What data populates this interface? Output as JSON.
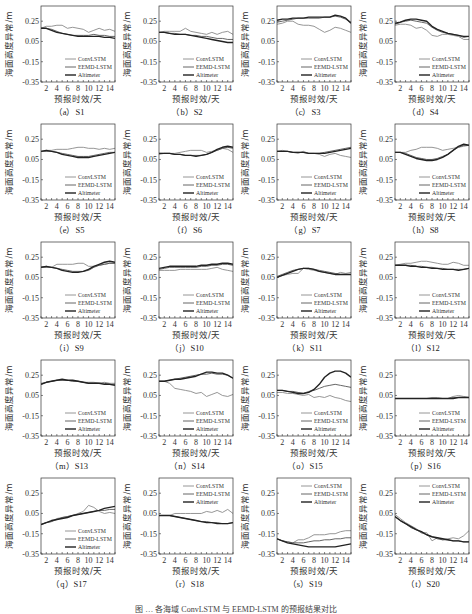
{
  "figure": {
    "caption_partial": "图 … 各海域 ConvLSTM 与 EEMD-LSTM 的预报结果对比"
  },
  "chart_data": {
    "type": "line",
    "shared": {
      "ylabel": "海面高度异常/m",
      "xlabel": "预报时效/天",
      "yticks": [
        0.25,
        0.05,
        -0.15,
        -0.35
      ],
      "ytick_labels": [
        "0.25",
        "0.05",
        "-0.15",
        "-0.35"
      ],
      "xticks": [
        2,
        4,
        6,
        8,
        10,
        12,
        14
      ],
      "ylim": [
        -0.35,
        0.4
      ],
      "xlim": [
        1,
        15
      ],
      "legend": [
        "ConvLSTM",
        "EEMD-LSTM",
        "Altimeter"
      ],
      "series_colors": {
        "ConvLSTM": "#8a8a8a",
        "EEMD-LSTM": "#555555",
        "Altimeter": "#222222"
      },
      "x": [
        1,
        2,
        3,
        4,
        5,
        6,
        7,
        8,
        9,
        10,
        11,
        12,
        13,
        14,
        15
      ]
    },
    "panels": [
      {
        "label": "（a）S1",
        "legend_pos": "bottom",
        "ConvLSTM": [
          0.18,
          0.2,
          0.2,
          0.21,
          0.21,
          0.18,
          0.19,
          0.18,
          0.17,
          0.14,
          0.16,
          0.18,
          0.16,
          0.17,
          0.15
        ],
        "EEMD-LSTM": [
          0.18,
          0.18,
          0.17,
          0.15,
          0.13,
          0.12,
          0.11,
          0.11,
          0.11,
          0.11,
          0.12,
          0.11,
          0.11,
          0.1,
          0.1
        ],
        "Altimeter": [
          0.18,
          0.18,
          0.16,
          0.14,
          0.13,
          0.12,
          0.11,
          0.1,
          0.1,
          0.1,
          0.1,
          0.1,
          0.09,
          0.09,
          0.08
        ]
      },
      {
        "label": "（b）S2",
        "legend_pos": "bottom",
        "ConvLSTM": [
          0.14,
          0.15,
          0.15,
          0.15,
          0.15,
          0.18,
          0.15,
          0.14,
          0.13,
          0.12,
          0.14,
          0.12,
          0.14,
          0.15,
          0.12
        ],
        "EEMD-LSTM": [
          0.14,
          0.14,
          0.13,
          0.13,
          0.12,
          0.12,
          0.11,
          0.11,
          0.1,
          0.1,
          0.09,
          0.08,
          0.08,
          0.07,
          0.07
        ],
        "Altimeter": [
          0.14,
          0.14,
          0.13,
          0.12,
          0.12,
          0.12,
          0.11,
          0.1,
          0.09,
          0.08,
          0.07,
          0.06,
          0.05,
          0.04,
          0.04
        ]
      },
      {
        "label": "（c）S3",
        "legend_pos": "bottom",
        "ConvLSTM": [
          0.22,
          0.23,
          0.25,
          0.25,
          0.22,
          0.21,
          0.21,
          0.2,
          0.17,
          0.14,
          0.16,
          0.19,
          0.18,
          0.16,
          0.14
        ],
        "EEMD-LSTM": [
          0.24,
          0.25,
          0.26,
          0.27,
          0.28,
          0.28,
          0.28,
          0.28,
          0.28,
          0.29,
          0.29,
          0.3,
          0.29,
          0.27,
          0.24
        ],
        "Altimeter": [
          0.26,
          0.27,
          0.27,
          0.28,
          0.28,
          0.28,
          0.29,
          0.29,
          0.29,
          0.29,
          0.29,
          0.31,
          0.3,
          0.28,
          0.23
        ]
      },
      {
        "label": "（d）S4",
        "legend_pos": "bottom",
        "ConvLSTM": [
          0.21,
          0.22,
          0.22,
          0.21,
          0.18,
          0.19,
          0.16,
          0.11,
          0.1,
          0.12,
          0.12,
          0.11,
          0.1,
          0.07,
          0.07
        ],
        "EEMD-LSTM": [
          0.22,
          0.24,
          0.25,
          0.26,
          0.25,
          0.24,
          0.23,
          0.19,
          0.16,
          0.14,
          0.13,
          0.12,
          0.11,
          0.09,
          0.1
        ],
        "Altimeter": [
          0.23,
          0.24,
          0.26,
          0.27,
          0.27,
          0.26,
          0.25,
          0.2,
          0.17,
          0.15,
          0.13,
          0.12,
          0.11,
          0.1,
          0.1
        ]
      },
      {
        "label": "（e）S5",
        "legend_pos": "bottom",
        "ConvLSTM": [
          0.13,
          0.14,
          0.14,
          0.15,
          0.15,
          0.15,
          0.16,
          0.17,
          0.17,
          0.16,
          0.16,
          0.15,
          0.16,
          0.15,
          0.16
        ],
        "EEMD-LSTM": [
          0.13,
          0.13,
          0.13,
          0.12,
          0.11,
          0.1,
          0.09,
          0.08,
          0.08,
          0.08,
          0.09,
          0.1,
          0.11,
          0.12,
          0.12
        ],
        "Altimeter": [
          0.13,
          0.14,
          0.13,
          0.12,
          0.1,
          0.09,
          0.08,
          0.07,
          0.07,
          0.07,
          0.08,
          0.09,
          0.1,
          0.11,
          0.12
        ]
      },
      {
        "label": "（f）S6",
        "legend_pos": "bottom",
        "ConvLSTM": [
          0.1,
          0.11,
          0.11,
          0.11,
          0.12,
          0.13,
          0.14,
          0.14,
          0.14,
          0.12,
          0.13,
          0.14,
          0.16,
          0.15,
          0.12
        ],
        "EEMD-LSTM": [
          0.11,
          0.11,
          0.11,
          0.1,
          0.1,
          0.09,
          0.09,
          0.09,
          0.09,
          0.1,
          0.12,
          0.14,
          0.16,
          0.17,
          0.16
        ],
        "Altimeter": [
          0.11,
          0.11,
          0.11,
          0.1,
          0.1,
          0.09,
          0.09,
          0.08,
          0.09,
          0.1,
          0.12,
          0.15,
          0.17,
          0.18,
          0.17
        ]
      },
      {
        "label": "（g）S7",
        "legend_pos": "bottom",
        "ConvLSTM": [
          0.13,
          0.14,
          0.13,
          0.12,
          0.11,
          0.13,
          0.11,
          0.11,
          0.1,
          0.08,
          0.1,
          0.11,
          0.09,
          0.08,
          0.07
        ],
        "EEMD-LSTM": [
          0.13,
          0.13,
          0.13,
          0.12,
          0.12,
          0.12,
          0.11,
          0.11,
          0.11,
          0.12,
          0.13,
          0.14,
          0.15,
          0.16,
          0.17
        ],
        "Altimeter": [
          0.13,
          0.13,
          0.13,
          0.12,
          0.12,
          0.12,
          0.11,
          0.11,
          0.11,
          0.11,
          0.12,
          0.13,
          0.14,
          0.15,
          0.16
        ]
      },
      {
        "label": "（h）S8",
        "legend_pos": "bottom",
        "ConvLSTM": [
          0.12,
          0.12,
          0.12,
          0.14,
          0.15,
          0.17,
          0.17,
          0.17,
          0.16,
          0.14,
          0.15,
          0.16,
          0.17,
          0.18,
          0.19
        ],
        "EEMD-LSTM": [
          0.12,
          0.12,
          0.11,
          0.09,
          0.07,
          0.06,
          0.05,
          0.05,
          0.06,
          0.08,
          0.1,
          0.14,
          0.17,
          0.19,
          0.19
        ],
        "Altimeter": [
          0.12,
          0.12,
          0.1,
          0.08,
          0.06,
          0.05,
          0.04,
          0.04,
          0.05,
          0.07,
          0.1,
          0.14,
          0.18,
          0.2,
          0.19
        ]
      },
      {
        "label": "（i）S9",
        "legend_pos": "bottom",
        "ConvLSTM": [
          0.15,
          0.16,
          0.15,
          0.18,
          0.18,
          0.18,
          0.18,
          0.19,
          0.19,
          0.16,
          0.16,
          0.17,
          0.18,
          0.19,
          0.19
        ],
        "EEMD-LSTM": [
          0.15,
          0.15,
          0.15,
          0.14,
          0.13,
          0.12,
          0.11,
          0.11,
          0.11,
          0.12,
          0.15,
          0.17,
          0.18,
          0.19,
          0.19
        ],
        "Altimeter": [
          0.15,
          0.16,
          0.15,
          0.14,
          0.12,
          0.11,
          0.1,
          0.1,
          0.11,
          0.13,
          0.16,
          0.18,
          0.2,
          0.21,
          0.2
        ]
      },
      {
        "label": "（j）S10",
        "legend_pos": "bottom",
        "ConvLSTM": [
          0.12,
          0.12,
          0.12,
          0.12,
          0.13,
          0.13,
          0.13,
          0.13,
          0.13,
          0.13,
          0.14,
          0.15,
          0.13,
          0.12,
          0.11
        ],
        "EEMD-LSTM": [
          0.13,
          0.14,
          0.15,
          0.15,
          0.15,
          0.15,
          0.15,
          0.15,
          0.16,
          0.16,
          0.17,
          0.17,
          0.18,
          0.18,
          0.17
        ],
        "Altimeter": [
          0.14,
          0.15,
          0.16,
          0.16,
          0.16,
          0.16,
          0.16,
          0.16,
          0.17,
          0.17,
          0.18,
          0.18,
          0.19,
          0.19,
          0.18
        ]
      },
      {
        "label": "（k）S11",
        "legend_pos": "bottom",
        "ConvLSTM": [
          0.05,
          0.07,
          0.08,
          0.09,
          0.09,
          0.14,
          0.13,
          0.12,
          0.11,
          0.1,
          0.09,
          0.08,
          0.1,
          0.09,
          0.1
        ],
        "EEMD-LSTM": [
          0.06,
          0.08,
          0.1,
          0.12,
          0.13,
          0.14,
          0.14,
          0.13,
          0.12,
          0.11,
          0.1,
          0.09,
          0.08,
          0.08,
          0.08
        ],
        "Altimeter": [
          0.05,
          0.07,
          0.09,
          0.11,
          0.13,
          0.14,
          0.14,
          0.13,
          0.11,
          0.1,
          0.09,
          0.08,
          0.08,
          0.08,
          0.08
        ]
      },
      {
        "label": "（l）S12",
        "legend_pos": "bottom",
        "ConvLSTM": [
          0.17,
          0.18,
          0.19,
          0.19,
          0.2,
          0.21,
          0.21,
          0.2,
          0.19,
          0.18,
          0.18,
          0.2,
          0.19,
          0.17,
          0.17
        ],
        "EEMD-LSTM": [
          0.17,
          0.17,
          0.17,
          0.17,
          0.16,
          0.16,
          0.15,
          0.15,
          0.14,
          0.14,
          0.13,
          0.13,
          0.13,
          0.13,
          0.14
        ],
        "Altimeter": [
          0.17,
          0.17,
          0.17,
          0.16,
          0.16,
          0.15,
          0.15,
          0.14,
          0.14,
          0.13,
          0.13,
          0.13,
          0.12,
          0.13,
          0.14
        ]
      },
      {
        "label": "（m）S13",
        "legend_pos": "bottom",
        "ConvLSTM": [
          0.17,
          0.18,
          0.19,
          0.2,
          0.2,
          0.2,
          0.19,
          0.19,
          0.18,
          0.18,
          0.18,
          0.17,
          0.18,
          0.17,
          0.17
        ],
        "EEMD-LSTM": [
          0.16,
          0.18,
          0.19,
          0.2,
          0.2,
          0.2,
          0.19,
          0.19,
          0.18,
          0.17,
          0.17,
          0.17,
          0.17,
          0.16,
          0.16
        ],
        "Altimeter": [
          0.16,
          0.18,
          0.19,
          0.2,
          0.21,
          0.2,
          0.2,
          0.19,
          0.18,
          0.17,
          0.17,
          0.17,
          0.16,
          0.16,
          0.15
        ]
      },
      {
        "label": "（n）S14",
        "legend_pos": "bottom",
        "ConvLSTM": [
          0.19,
          0.19,
          0.17,
          0.12,
          0.11,
          0.1,
          0.09,
          0.07,
          0.08,
          0.04,
          0.06,
          0.08,
          0.05,
          0.04,
          0.06
        ],
        "EEMD-LSTM": [
          0.19,
          0.19,
          0.2,
          0.21,
          0.22,
          0.23,
          0.24,
          0.25,
          0.26,
          0.26,
          0.27,
          0.26,
          0.26,
          0.25,
          0.22
        ],
        "Altimeter": [
          0.19,
          0.19,
          0.2,
          0.21,
          0.21,
          0.22,
          0.23,
          0.24,
          0.26,
          0.28,
          0.28,
          0.27,
          0.27,
          0.25,
          0.22
        ]
      },
      {
        "label": "（o）S15",
        "legend_pos": "bottom",
        "ConvLSTM": [
          0.08,
          0.08,
          0.07,
          0.07,
          0.06,
          0.05,
          0.06,
          0.03,
          0.04,
          0.03,
          0.05,
          0.03,
          0.02,
          0.0,
          -0.01
        ],
        "EEMD-LSTM": [
          0.1,
          0.1,
          0.09,
          0.09,
          0.08,
          0.07,
          0.09,
          0.1,
          0.12,
          0.14,
          0.15,
          0.16,
          0.15,
          0.14,
          0.13
        ],
        "Altimeter": [
          0.1,
          0.1,
          0.09,
          0.08,
          0.07,
          0.07,
          0.08,
          0.11,
          0.16,
          0.23,
          0.27,
          0.29,
          0.29,
          0.27,
          0.23
        ]
      },
      {
        "label": "（p）S16",
        "legend_pos": "bottom",
        "ConvLSTM": [
          0.02,
          0.02,
          0.02,
          0.02,
          0.02,
          0.02,
          0.02,
          0.03,
          0.03,
          0.02,
          0.02,
          0.04,
          0.05,
          0.04,
          0.03
        ],
        "EEMD-LSTM": [
          0.02,
          0.02,
          0.02,
          0.02,
          0.02,
          0.02,
          0.02,
          0.02,
          0.02,
          0.02,
          0.02,
          0.03,
          0.03,
          0.03,
          0.03
        ],
        "Altimeter": [
          0.02,
          0.02,
          0.02,
          0.02,
          0.02,
          0.02,
          0.02,
          0.02,
          0.02,
          0.02,
          0.02,
          0.02,
          0.03,
          0.03,
          0.03
        ]
      },
      {
        "label": "（q）S17",
        "legend_pos": "bottom",
        "ConvLSTM": [
          -0.06,
          -0.04,
          -0.03,
          0.0,
          0.01,
          0.02,
          0.03,
          0.05,
          0.07,
          0.13,
          0.11,
          0.07,
          0.05,
          0.06,
          0.05
        ],
        "EEMD-LSTM": [
          -0.06,
          -0.04,
          -0.03,
          -0.01,
          0.01,
          0.02,
          0.03,
          0.04,
          0.05,
          0.06,
          0.07,
          0.08,
          0.08,
          0.09,
          0.09
        ],
        "Altimeter": [
          -0.06,
          -0.04,
          -0.02,
          -0.01,
          0.0,
          0.01,
          0.03,
          0.04,
          0.05,
          0.06,
          0.07,
          0.08,
          0.1,
          0.11,
          0.12
        ]
      },
      {
        "label": "（r）S18",
        "legend_pos": "top",
        "ConvLSTM": [
          0.03,
          0.03,
          0.03,
          0.05,
          0.05,
          0.05,
          0.05,
          0.05,
          0.05,
          0.07,
          0.06,
          0.08,
          0.06,
          0.09,
          0.05
        ],
        "EEMD-LSTM": [
          0.03,
          0.03,
          0.03,
          0.02,
          0.01,
          0.0,
          -0.01,
          -0.02,
          -0.03,
          -0.03,
          -0.04,
          -0.04,
          -0.05,
          -0.05,
          -0.04
        ],
        "Altimeter": [
          0.03,
          0.03,
          0.03,
          0.02,
          0.01,
          0.0,
          -0.01,
          -0.02,
          -0.03,
          -0.04,
          -0.04,
          -0.05,
          -0.05,
          -0.05,
          -0.04
        ]
      },
      {
        "label": "（s）S19",
        "legend_pos": "top",
        "ConvLSTM": [
          -0.2,
          -0.22,
          -0.23,
          -0.24,
          -0.21,
          -0.21,
          -0.19,
          -0.16,
          -0.16,
          -0.16,
          -0.15,
          -0.15,
          -0.13,
          -0.12,
          -0.12
        ],
        "EEMD-LSTM": [
          -0.2,
          -0.22,
          -0.23,
          -0.24,
          -0.24,
          -0.24,
          -0.23,
          -0.22,
          -0.22,
          -0.21,
          -0.21,
          -0.2,
          -0.2,
          -0.19,
          -0.19
        ],
        "Altimeter": [
          -0.2,
          -0.22,
          -0.24,
          -0.25,
          -0.26,
          -0.27,
          -0.28,
          -0.28,
          -0.28,
          -0.28,
          -0.28,
          -0.28,
          -0.27,
          -0.26,
          -0.25
        ]
      },
      {
        "label": "（t）S20",
        "legend_pos": "top",
        "ConvLSTM": [
          0.04,
          0.0,
          -0.04,
          -0.07,
          -0.1,
          -0.14,
          -0.14,
          -0.22,
          -0.19,
          -0.21,
          -0.2,
          -0.19,
          -0.2,
          -0.17,
          -0.12
        ],
        "EEMD-LSTM": [
          0.02,
          -0.02,
          -0.05,
          -0.09,
          -0.11,
          -0.14,
          -0.16,
          -0.18,
          -0.2,
          -0.21,
          -0.21,
          -0.22,
          -0.22,
          -0.23,
          -0.23
        ],
        "Altimeter": [
          0.02,
          -0.02,
          -0.05,
          -0.08,
          -0.11,
          -0.13,
          -0.16,
          -0.18,
          -0.19,
          -0.2,
          -0.21,
          -0.22,
          -0.22,
          -0.23,
          -0.23
        ]
      }
    ]
  }
}
